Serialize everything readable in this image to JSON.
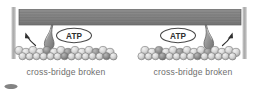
{
  "figure": {
    "background_color": "#ffffff",
    "panels": [
      {
        "id": "left",
        "caption": "cross-bridge broken",
        "atp_label": "ATP",
        "arrow_direction": "up-left"
      },
      {
        "id": "right",
        "caption": "cross-bridge broken",
        "atp_label": "ATP",
        "arrow_direction": "up-right"
      }
    ],
    "elements": {
      "thick_filament_name": "myosin thick filament",
      "thin_filament_name": "actin thin filament",
      "cross_bridge_name": "myosin head cross-bridge",
      "z_line_name": "z-line"
    },
    "colors": {
      "thick_filament": "#8a8a8a",
      "thick_filament_stripe": "#636363",
      "thin_filament_bead": "#d8d8d8",
      "thin_filament_bead_edge": "#777777",
      "cross_bridge": "#9a9a9a",
      "cross_bridge_edge": "#5f5f5f",
      "z_line": "#b0b0b0",
      "atp_outline": "#4a4a4a",
      "atp_text": "#3a3a3a",
      "caption_text": "#6e6e6e",
      "arrow": "#2f2f2f"
    }
  }
}
